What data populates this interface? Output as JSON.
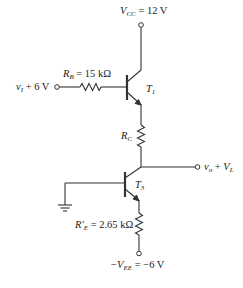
{
  "diagram": {
    "type": "circuit-schematic",
    "supply": {
      "vcc_symbol": "V",
      "vcc_sub": "CC",
      "vcc_value": " = 12 V",
      "vee_prefix": "−V",
      "vee_sub": "EE",
      "vee_value": " = −6 V"
    },
    "input": {
      "label_v": "v",
      "label_sub": "I",
      "label_rest": " + 6 V"
    },
    "output": {
      "label_v": "v",
      "label_sub": "o",
      "label_plus": " + ",
      "label_V": "V",
      "label_V_sub": "L"
    },
    "components": {
      "rb": {
        "symbol": "R",
        "sub": "B",
        "value": " = 15 kΩ"
      },
      "rc": {
        "symbol": "R",
        "sub": "C"
      },
      "re": {
        "symbol": "R′",
        "sub": "E",
        "value": " = 2.65 kΩ"
      },
      "t1": {
        "symbol": "T",
        "sub": "1"
      },
      "t3": {
        "symbol": "T",
        "sub": "3"
      }
    }
  }
}
